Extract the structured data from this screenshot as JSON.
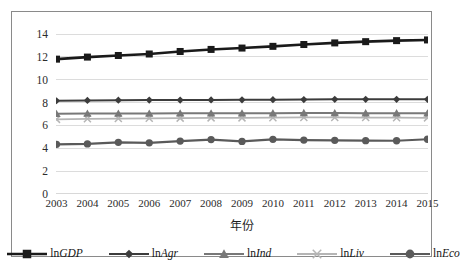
{
  "chart_data": {
    "type": "line",
    "title": "",
    "xlabel": "年份",
    "ylabel": "",
    "categories": [
      2003,
      2004,
      2005,
      2006,
      2007,
      2008,
      2009,
      2010,
      2011,
      2012,
      2013,
      2014,
      2015
    ],
    "ylim": [
      0,
      14
    ],
    "ytick_step": 2,
    "yticks": [
      0,
      2,
      4,
      6,
      8,
      10,
      12,
      14
    ],
    "grid": "horizontal",
    "legend_position": "bottom",
    "series": [
      {
        "name": "lnGDP",
        "name_prefix": "ln",
        "name_italic": "GDP",
        "marker": "square",
        "color": "#1a1a1a",
        "line_width": 2.6,
        "marker_size": 7,
        "values": [
          11.8,
          11.98,
          12.12,
          12.25,
          12.47,
          12.65,
          12.77,
          12.92,
          13.08,
          13.22,
          13.33,
          13.42,
          13.48
        ]
      },
      {
        "name": "lnAgr",
        "name_prefix": "ln",
        "name_italic": "Agr",
        "marker": "diamond",
        "color": "#3c3c3c",
        "line_width": 2.0,
        "marker_size": 6,
        "values": [
          8.16,
          8.19,
          8.21,
          8.22,
          8.22,
          8.23,
          8.24,
          8.25,
          8.26,
          8.28,
          8.28,
          8.28,
          8.28
        ]
      },
      {
        "name": "lnInd",
        "name_prefix": "ln",
        "name_italic": "Ind",
        "marker": "triangle",
        "color": "#787878",
        "line_width": 2.0,
        "marker_size": 6,
        "values": [
          7.02,
          7.04,
          7.04,
          7.04,
          7.06,
          7.06,
          7.06,
          7.07,
          7.09,
          7.08,
          7.07,
          7.07,
          7.06
        ]
      },
      {
        "name": "lnLiv",
        "name_prefix": "ln",
        "name_italic": "Liv",
        "marker": "x",
        "color": "#b5b5b5",
        "line_width": 1.8,
        "marker_size": 7,
        "values": [
          6.53,
          6.58,
          6.6,
          6.62,
          6.64,
          6.66,
          6.66,
          6.68,
          6.7,
          6.7,
          6.69,
          6.68,
          6.66
        ]
      },
      {
        "name": "lnEco",
        "name_prefix": "ln",
        "name_italic": "Eco",
        "marker": "circle",
        "color": "#5a5a5a",
        "line_width": 2.2,
        "marker_size": 6.5,
        "values": [
          4.35,
          4.38,
          4.52,
          4.48,
          4.63,
          4.76,
          4.6,
          4.78,
          4.72,
          4.7,
          4.67,
          4.66,
          4.79
        ]
      }
    ]
  },
  "figure": {
    "caption": ""
  }
}
